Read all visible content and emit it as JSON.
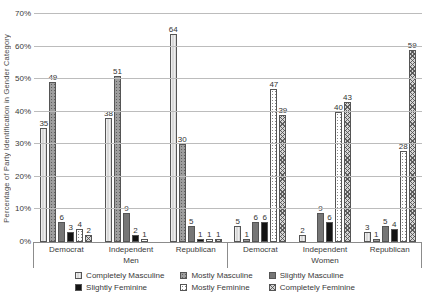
{
  "chart_data": {
    "type": "bar",
    "title": "",
    "xlabel": "",
    "ylabel": "Percentage of Party Identification in Gender Category",
    "ylim": [
      0,
      70
    ],
    "ytick_step": 10,
    "yticks": [
      "0%",
      "10%",
      "20%",
      "30%",
      "40%",
      "50%",
      "60%",
      "70%"
    ],
    "grid": true,
    "bar_value_labels_visible": true,
    "legend_position": "bottom",
    "categories": [
      "Democrat",
      "Independent",
      "Republican",
      "Democrat",
      "Independent",
      "Republican"
    ],
    "category_groups": [
      {
        "label": "Men",
        "category_indexes": [
          0,
          1,
          2
        ]
      },
      {
        "label": "Women",
        "category_indexes": [
          3,
          4,
          5
        ]
      }
    ],
    "series": [
      {
        "name": "Completely Masculine",
        "pattern": "light-gray",
        "values": [
          35,
          38,
          64,
          5,
          2,
          3
        ]
      },
      {
        "name": "Mostly Masculine",
        "pattern": "gray-dots",
        "values": [
          49,
          51,
          30,
          1,
          0,
          1
        ]
      },
      {
        "name": "Slightly Masculine",
        "pattern": "dark-gray",
        "values": [
          6,
          9,
          5,
          6,
          9,
          5
        ]
      },
      {
        "name": "Slightly Feminine",
        "pattern": "black",
        "values": [
          3,
          2,
          1,
          6,
          6,
          4
        ]
      },
      {
        "name": "Mostly Feminine",
        "pattern": "white-dots",
        "values": [
          4,
          1,
          1,
          47,
          40,
          28
        ]
      },
      {
        "name": "Completely Feminine",
        "pattern": "crosshatch",
        "values": [
          2,
          0,
          1,
          39,
          43,
          59
        ]
      }
    ]
  },
  "colors": {
    "gridline": "#bcbcbc",
    "axis": "#8c8c8c",
    "text": "#3a3a3a",
    "bar_outline": "#555555",
    "light_gray": "#d9d9d9",
    "gray_dots": "#9e9e9e",
    "dark_gray": "#767676",
    "black": "#141414",
    "white_dots": "#ffffff",
    "crosshatch_base": "#d6d6d6"
  }
}
